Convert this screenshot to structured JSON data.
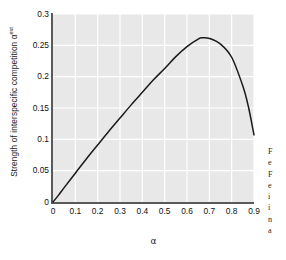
{
  "chart_data": {
    "type": "line",
    "title": "",
    "xlabel": "α",
    "ylabel": "Strength of  interspecific competition α",
    "ylabel_superscript": "est",
    "xlim": [
      0,
      0.9
    ],
    "ylim": [
      0,
      0.3
    ],
    "grid": true,
    "grid_color": "#ffffff",
    "plot_bg": "#e8e8e8",
    "line_color": "#1a1a1a",
    "legend": "none",
    "xticks": [
      "0",
      "0.1",
      "0.2",
      "0.3",
      "0.4",
      "0.5",
      "0.6",
      "0.7",
      "0.8",
      "0.9"
    ],
    "xtick_values": [
      0,
      0.1,
      0.2,
      0.3,
      0.4,
      0.5,
      0.6,
      0.7,
      0.8,
      0.9
    ],
    "yticks": [
      "0",
      "0.05",
      "0.1",
      "0.15",
      "0.2",
      "0.25",
      "0.3"
    ],
    "ytick_values": [
      0,
      0.05,
      0.1,
      0.15,
      0.2,
      0.25,
      0.3
    ],
    "series": [
      {
        "name": "estimated interspecific competition",
        "x": [
          0.0,
          0.025,
          0.05,
          0.1,
          0.15,
          0.2,
          0.25,
          0.3,
          0.35,
          0.4,
          0.45,
          0.5,
          0.55,
          0.6,
          0.65,
          0.67,
          0.7,
          0.75,
          0.8,
          0.85,
          0.875,
          0.9
        ],
        "y": [
          0.0,
          0.011,
          0.023,
          0.046,
          0.069,
          0.091,
          0.113,
          0.134,
          0.155,
          0.175,
          0.195,
          0.213,
          0.232,
          0.248,
          0.26,
          0.262,
          0.261,
          0.252,
          0.231,
          0.185,
          0.152,
          0.107
        ]
      }
    ],
    "peak": {
      "x": 0.67,
      "y": 0.262
    }
  },
  "side_text": {
    "lines": "F\ne\nF\ne\ni\ni\nn\na"
  }
}
